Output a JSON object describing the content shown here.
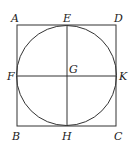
{
  "diagram": {
    "type": "geometry",
    "square": {
      "vertices": [
        "A",
        "D",
        "C",
        "B"
      ],
      "x1": 17,
      "y1": 25,
      "x2": 116,
      "y2": 126
    },
    "circle": {
      "cx": 66.5,
      "cy": 75.5,
      "r": 50
    },
    "segments": [
      {
        "name": "EH",
        "from": "E",
        "to": "H"
      },
      {
        "name": "FK",
        "from": "F",
        "to": "K"
      }
    ],
    "labels": {
      "A": "A",
      "B": "B",
      "C": "C",
      "D": "D",
      "E": "E",
      "F": "F",
      "G": "G",
      "H": "H",
      "K": "K"
    },
    "stroke_color": "#333333"
  }
}
